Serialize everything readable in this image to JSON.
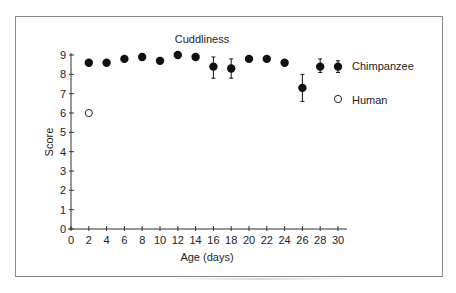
{
  "chart_data": {
    "type": "scatter",
    "title": "Cuddliness",
    "xlabel": "Age (days)",
    "ylabel": "Score",
    "xlim": [
      0,
      31
    ],
    "ylim": [
      0,
      9
    ],
    "xticks": [
      0,
      2,
      4,
      6,
      8,
      10,
      12,
      14,
      16,
      18,
      20,
      22,
      24,
      26,
      28,
      30
    ],
    "yticks": [
      0,
      1,
      2,
      3,
      4,
      5,
      6,
      7,
      8,
      9
    ],
    "grid": false,
    "legend_position": "right",
    "series": [
      {
        "name": "Chimpanzee",
        "marker": "filled-circle",
        "color": "#000000",
        "x": [
          2,
          4,
          6,
          8,
          10,
          12,
          14,
          16,
          18,
          20,
          22,
          24,
          26,
          28,
          30
        ],
        "values": [
          8.6,
          8.6,
          8.8,
          8.9,
          8.7,
          9.0,
          8.9,
          8.4,
          8.3,
          8.8,
          8.8,
          8.6,
          7.3,
          8.4,
          8.4
        ],
        "error_low": [
          null,
          null,
          null,
          null,
          null,
          null,
          null,
          7.8,
          7.8,
          null,
          null,
          null,
          6.6,
          8.1,
          8.1
        ],
        "error_high": [
          null,
          null,
          null,
          null,
          null,
          null,
          null,
          8.9,
          8.8,
          null,
          null,
          null,
          8.0,
          8.8,
          8.7
        ]
      },
      {
        "name": "Human",
        "marker": "open-circle",
        "color": "#000000",
        "x": [
          2
        ],
        "values": [
          6.0
        ]
      }
    ]
  },
  "legend": {
    "items": [
      {
        "label": "Chimpanzee"
      },
      {
        "label": "Human"
      }
    ]
  }
}
